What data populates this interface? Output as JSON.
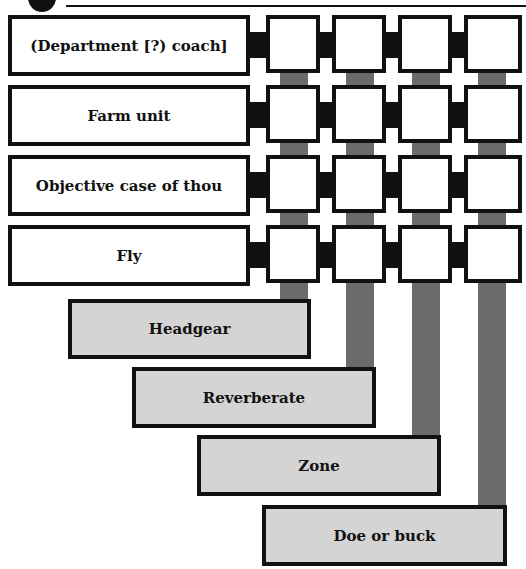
{
  "puzzle": {
    "type": "crossword-grid",
    "across_clues": [
      {
        "label": "(Department [?) coach]"
      },
      {
        "label": "Farm unit"
      },
      {
        "label": "Objective case of thou"
      },
      {
        "label": "Fly"
      }
    ],
    "down_clues": [
      {
        "label": "Headgear"
      },
      {
        "label": "Reverberate"
      },
      {
        "label": "Zone"
      },
      {
        "label": "Doe or buck"
      }
    ],
    "grid": {
      "rows": 4,
      "cols": 4,
      "cells": [
        [
          "",
          "",
          "",
          ""
        ],
        [
          "",
          "",
          "",
          ""
        ],
        [
          "",
          "",
          "",
          ""
        ],
        [
          "",
          "",
          "",
          ""
        ]
      ]
    },
    "colors": {
      "border": "#111111",
      "cell_fill": "#ffffff",
      "answer_fill": "#d4d4d4",
      "down_bar": "#6b6b6b"
    }
  }
}
